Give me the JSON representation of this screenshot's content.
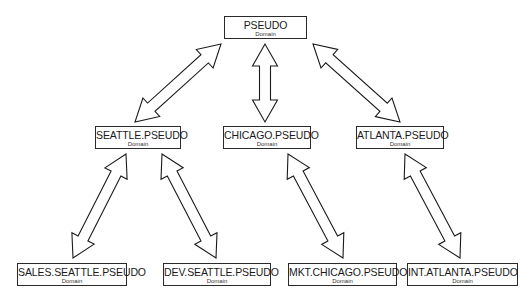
{
  "diagram": {
    "title": "",
    "nodes": [
      {
        "id": "pseudo",
        "name": "PSEUDO",
        "type": "Domain"
      },
      {
        "id": "seattle",
        "name": "SEATTLE.PSEUDO",
        "type": "Domain"
      },
      {
        "id": "chicago",
        "name": "CHICAGO.PSEUDO",
        "type": "Domain"
      },
      {
        "id": "atlanta",
        "name": "ATLANTA.PSEUDO",
        "type": "Domain"
      },
      {
        "id": "sales-seattle",
        "name": "SALES.SEATTLE.PSEUDO",
        "type": "Domain"
      },
      {
        "id": "dev-seattle",
        "name": "DEV.SEATTLE.PSEUDO",
        "type": "Domain"
      },
      {
        "id": "mkt-chicago",
        "name": "MKT.CHICAGO.PSEUDO",
        "type": "Domain"
      },
      {
        "id": "int-atlanta",
        "name": "INT.ATLANTA.PSEUDO",
        "type": "Domain"
      }
    ],
    "edges": [
      {
        "from": "pseudo",
        "to": "seattle",
        "style": "bidirectional-block-arrow"
      },
      {
        "from": "pseudo",
        "to": "chicago",
        "style": "bidirectional-block-arrow"
      },
      {
        "from": "pseudo",
        "to": "atlanta",
        "style": "bidirectional-block-arrow"
      },
      {
        "from": "seattle",
        "to": "sales-seattle",
        "style": "bidirectional-block-arrow"
      },
      {
        "from": "seattle",
        "to": "dev-seattle",
        "style": "bidirectional-block-arrow"
      },
      {
        "from": "chicago",
        "to": "mkt-chicago",
        "style": "bidirectional-block-arrow"
      },
      {
        "from": "atlanta",
        "to": "int-atlanta",
        "style": "bidirectional-block-arrow"
      }
    ]
  }
}
